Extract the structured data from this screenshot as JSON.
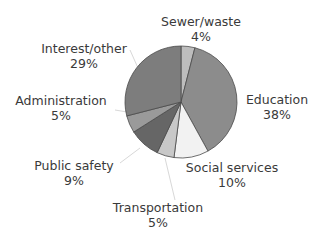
{
  "chart_data": {
    "type": "pie",
    "title": "",
    "start_angle": "12 o'clock",
    "direction": "clockwise",
    "categories": [
      "Sewer/waste",
      "Education",
      "Social services",
      "Transportation",
      "Public safety",
      "Administration",
      "Interest/other"
    ],
    "values": [
      4,
      38,
      10,
      5,
      9,
      5,
      29
    ],
    "unit": "%",
    "colors": [
      "#bdbdbd",
      "#8c8c8c",
      "#f2f2f2",
      "#c8c8c8",
      "#666666",
      "#9a9a9a",
      "#7d7d7d"
    ],
    "labels": [
      {
        "name": "Sewer/waste",
        "pct": "4%"
      },
      {
        "name": "Education",
        "pct": "38%"
      },
      {
        "name": "Social services",
        "pct": "10%"
      },
      {
        "name": "Transportation",
        "pct": "5%"
      },
      {
        "name": "Public safety",
        "pct": "9%"
      },
      {
        "name": "Administration",
        "pct": "5%"
      },
      {
        "name": "Interest/other",
        "pct": "29%"
      }
    ],
    "legend": "none (direct labels)"
  }
}
